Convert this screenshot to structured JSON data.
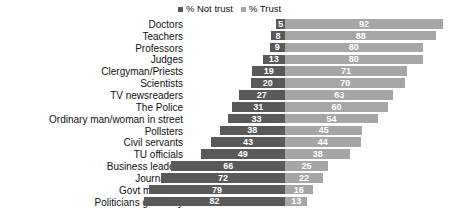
{
  "legend": {
    "position": "top-center",
    "entries": [
      {
        "label": "% Not trust",
        "color": "#595959",
        "swatch_icon": "square-swatch-icon"
      },
      {
        "label": "% Trust",
        "color": "#a6a6a6",
        "swatch_icon": "square-swatch-icon"
      }
    ]
  },
  "colors": {
    "not_trust": "#595959",
    "trust": "#a6a6a6",
    "background": "#ffffff",
    "label_text": "#111111",
    "value_text": "#ffffff"
  },
  "chart_data": {
    "type": "bar",
    "orientation": "horizontal",
    "layout": "diverging",
    "title": "",
    "subtitle": "",
    "xlabel": "",
    "ylabel": "",
    "grid": false,
    "legend_position": "top-center",
    "axis_origin_percent": 0,
    "xlim": [
      -100,
      100
    ],
    "categories": [
      "Doctors",
      "Teachers",
      "Professors",
      "Judges",
      "Clergyman/Priests",
      "Scientists",
      "TV newsreaders",
      "The Police",
      "Ordinary man/woman in street",
      "Pollsters",
      "Civil servants",
      "TU officials",
      "Business leaders",
      "Journalists",
      "Govt ministers",
      "Politicians generally"
    ],
    "series": [
      {
        "name": "% Not trust",
        "color": "#595959",
        "direction": "left",
        "values": [
          5,
          8,
          9,
          13,
          19,
          20,
          27,
          31,
          33,
          38,
          43,
          49,
          66,
          72,
          79,
          82
        ]
      },
      {
        "name": "% Trust",
        "color": "#a6a6a6",
        "direction": "right",
        "values": [
          92,
          88,
          80,
          80,
          71,
          70,
          63,
          60,
          54,
          45,
          44,
          38,
          25,
          22,
          16,
          13
        ]
      }
    ]
  }
}
